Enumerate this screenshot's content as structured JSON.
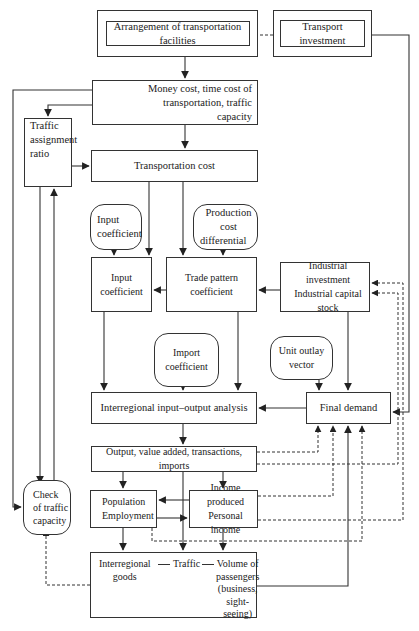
{
  "diagram": {
    "nodes": {
      "arrangement": "Arrangement of transportation facilities",
      "transport_investment": "Transport investment",
      "money_cost": [
        "Money cost, time cost of transportation, traffic",
        "capacity"
      ],
      "traffic_assignment": [
        "Traffic",
        "assignment",
        "ratio"
      ],
      "transportation_cost": "Transportation cost",
      "input_coefficient_param": [
        "Input",
        "coefficient"
      ],
      "production_cost_differential": [
        "Production cost",
        "differential"
      ],
      "input_coefficient": "Input coefficient",
      "trade_pattern_coefficient": "Trade pattern coefficient",
      "industrial": [
        "Industrial investment",
        "Industrial capital stock"
      ],
      "import_coefficient": "Import coefficient",
      "unit_outlay_vector": "Unit outlay vector",
      "interregional_io": "Interregional input–output analysis",
      "final_demand": "Final demand",
      "output": "Output, value added, transactions, imports",
      "population": [
        "Population",
        "Employment"
      ],
      "income": [
        "Income produced",
        "Personal income"
      ],
      "check_traffic": [
        "Check",
        "of traffic",
        "capacity"
      ],
      "traffic_bottom": {
        "goods": [
          "Interregional",
          "goods"
        ],
        "traffic": "Traffic",
        "passengers": [
          "Volume of",
          "passengers",
          "(business,",
          "sight-seeing)"
        ]
      }
    },
    "edges": [
      {
        "from": "transport_investment",
        "to": "arrangement",
        "style": "dashed"
      },
      {
        "from": "transport_investment",
        "to": "final_demand",
        "style": "solid"
      },
      {
        "from": "arrangement",
        "to": "money_cost",
        "style": "solid"
      },
      {
        "from": "money_cost",
        "to": "traffic_assignment",
        "style": "solid"
      },
      {
        "from": "money_cost",
        "to": "check_traffic",
        "style": "solid"
      },
      {
        "from": "money_cost",
        "to": "transportation_cost",
        "style": "solid"
      },
      {
        "from": "traffic_assignment",
        "to": "transportation_cost",
        "style": "solid"
      },
      {
        "from": "traffic_assignment",
        "to": "check_traffic",
        "style": "solid"
      },
      {
        "from": "check_traffic",
        "to": "traffic_assignment",
        "style": "solid"
      },
      {
        "from": "transportation_cost",
        "to": "input_coefficient",
        "style": "solid"
      },
      {
        "from": "transportation_cost",
        "to": "trade_pattern_coefficient",
        "style": "solid"
      },
      {
        "from": "input_coefficient_param",
        "to": "input_coefficient",
        "style": "solid"
      },
      {
        "from": "production_cost_differential",
        "to": "trade_pattern_coefficient",
        "style": "solid"
      },
      {
        "from": "trade_pattern_coefficient",
        "to": "input_coefficient",
        "style": "solid"
      },
      {
        "from": "industrial",
        "to": "trade_pattern_coefficient",
        "style": "solid"
      },
      {
        "from": "industrial",
        "to": "final_demand",
        "style": "solid"
      },
      {
        "from": "input_coefficient",
        "to": "interregional_io",
        "style": "solid"
      },
      {
        "from": "import_coefficient",
        "to": "interregional_io",
        "style": "solid"
      },
      {
        "from": "trade_pattern_coefficient",
        "to": "interregional_io",
        "style": "solid"
      },
      {
        "from": "unit_outlay_vector",
        "to": "final_demand",
        "style": "solid"
      },
      {
        "from": "final_demand",
        "to": "interregional_io",
        "style": "solid"
      },
      {
        "from": "interregional_io",
        "to": "output",
        "style": "solid"
      },
      {
        "from": "output",
        "to": "final_demand",
        "style": "dashed"
      },
      {
        "from": "output",
        "to": "industrial",
        "style": "dashed"
      },
      {
        "from": "output",
        "to": "population",
        "style": "solid"
      },
      {
        "from": "output",
        "to": "income",
        "style": "solid"
      },
      {
        "from": "output",
        "to": "traffic_bottom",
        "style": "solid"
      },
      {
        "from": "income",
        "to": "population",
        "style": "solid"
      },
      {
        "from": "population",
        "to": "income",
        "style": "solid"
      },
      {
        "from": "income",
        "to": "final_demand",
        "style": "dashed"
      },
      {
        "from": "income",
        "to": "industrial",
        "style": "dashed"
      },
      {
        "from": "population",
        "to": "final_demand",
        "style": "dashed"
      },
      {
        "from": "population",
        "to": "traffic_bottom",
        "style": "solid"
      },
      {
        "from": "income",
        "to": "traffic_bottom",
        "style": "solid"
      },
      {
        "from": "traffic_bottom",
        "to": "final_demand",
        "style": "solid"
      },
      {
        "from": "traffic_bottom",
        "to": "check_traffic",
        "style": "dashed"
      }
    ]
  }
}
